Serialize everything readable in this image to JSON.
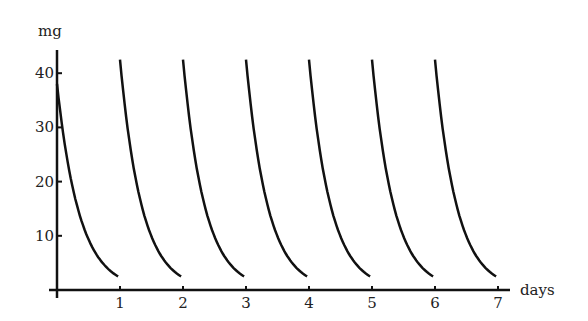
{
  "chart_data": {
    "type": "line",
    "title": "",
    "xlabel": "days",
    "ylabel": "mg",
    "xlim": [
      0,
      7
    ],
    "ylim": [
      0,
      45
    ],
    "grid": false,
    "legend": null,
    "x_ticks": [
      "1",
      "2",
      "3",
      "4",
      "5",
      "6",
      "7"
    ],
    "y_ticks": [
      "10",
      "20",
      "30",
      "40"
    ],
    "series": [
      {
        "name": "day0",
        "start_day": 0,
        "start_value": 38,
        "end_day": 1,
        "end_value": 2.5
      },
      {
        "name": "day1",
        "start_day": 1,
        "start_value": 42.5,
        "end_day": 2,
        "end_value": 2.5
      },
      {
        "name": "day2",
        "start_day": 2,
        "start_value": 42.5,
        "end_day": 3,
        "end_value": 2.5
      },
      {
        "name": "day3",
        "start_day": 3,
        "start_value": 42.5,
        "end_day": 4,
        "end_value": 2.5
      },
      {
        "name": "day4",
        "start_day": 4,
        "start_value": 42.5,
        "end_day": 5,
        "end_value": 2.5
      },
      {
        "name": "day5",
        "start_day": 5,
        "start_value": 42.5,
        "end_day": 6,
        "end_value": 2.5
      },
      {
        "name": "day6",
        "start_day": 6,
        "start_value": 42.5,
        "end_day": 7,
        "end_value": 2.5
      }
    ]
  },
  "axes": {
    "x_label": "days",
    "y_label": "mg"
  }
}
